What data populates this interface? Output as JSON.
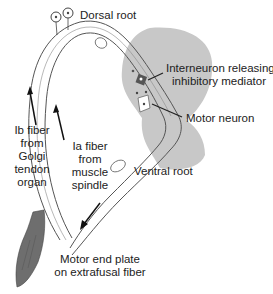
{
  "labels": {
    "dorsal_root": "Dorsal root",
    "interneuron_line1": "Interneuron releasing",
    "interneuron_line2": "inhibitory mediator",
    "motor_neuron": "Motor neuron",
    "ventral_root": "Ventral root",
    "ib_fiber": [
      "Ib fiber",
      "from",
      "Golgi",
      "tendon",
      "organ"
    ],
    "ia_fiber": [
      "Ia fiber",
      "from",
      "muscle",
      "spindle"
    ],
    "motor_end_plate_line1": "Motor end plate",
    "motor_end_plate_line2": "on extrafusal fiber"
  },
  "colors": {
    "spinal_cord_gray": "#c8c8c8",
    "muscle": "#6e6e6e",
    "nerve_outline": "#555555",
    "interneuron": "#555555",
    "text": "#222222"
  }
}
